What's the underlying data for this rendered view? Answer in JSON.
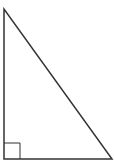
{
  "diagram": {
    "type": "right-triangle",
    "stroke_color": "#333333",
    "background": "#ffffff",
    "vertices": {
      "top": [
        4,
        9
      ],
      "bottom_left": [
        4,
        159
      ],
      "bottom_right": [
        112,
        159
      ]
    },
    "right_angle_marker": {
      "corner": "bottom_left",
      "size": 16
    }
  }
}
